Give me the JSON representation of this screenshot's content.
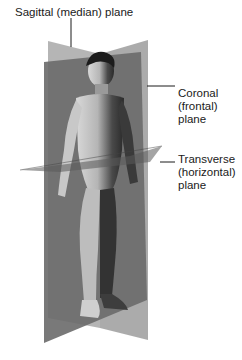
{
  "figure": {
    "colors": {
      "sagittal_plane": "#8a8a8a",
      "coronal_plane": "#6e6e6e",
      "transverse_plane": "#777777",
      "leader_line": "#1a1a1a",
      "background": "#ffffff"
    }
  },
  "labels": {
    "sagittal": "Sagittal (median) plane",
    "coronal": [
      "Coronal",
      "(frontal)",
      "plane"
    ],
    "transverse": [
      "Transverse",
      "(horizontal)",
      "plane"
    ]
  }
}
